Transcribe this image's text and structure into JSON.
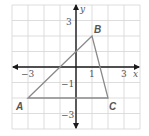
{
  "diagram": {
    "type": "coordinate-plane-triangle",
    "grid": {
      "xmin": -4,
      "xmax": 4,
      "ymin": -4,
      "ymax": 4,
      "step": 1
    },
    "axes": {
      "x_label": "x",
      "y_label": "y"
    },
    "ticks": {
      "x_neg3": "−3",
      "x_1": "1",
      "x_3": "3",
      "y_3": "3",
      "y_neg1": "−1",
      "y_neg3": "−3"
    },
    "points": [
      {
        "label": "A",
        "x": -3,
        "y": -2
      },
      {
        "label": "B",
        "x": 1,
        "y": 2
      },
      {
        "label": "C",
        "x": 2,
        "y": -2
      }
    ],
    "colors": {
      "grid": "#d4d4d4",
      "axis": "#1a1a1a",
      "triangle": "#8a8a8a",
      "label": "#555555"
    }
  }
}
